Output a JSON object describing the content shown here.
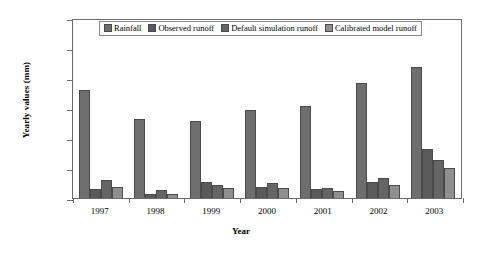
{
  "chart_data": {
    "type": "bar",
    "title": "",
    "xlabel": "Year",
    "ylabel": "Yearly values (mm)",
    "ylim": [
      0,
      1200
    ],
    "yticks": [
      0,
      200,
      400,
      600,
      800,
      1000,
      1200
    ],
    "grid": false,
    "legend_position": "top-center",
    "categories": [
      "1997",
      "1998",
      "1999",
      "2000",
      "2001",
      "2002",
      "2003"
    ],
    "series": [
      {
        "name": "Rainfall",
        "color": "#6e6e6e",
        "values": [
          720,
          525,
          515,
          585,
          615,
          770,
          875
        ]
      },
      {
        "name": "Observed runoff",
        "color": "#5a5a5a",
        "values": [
          60,
          30,
          105,
          75,
          60,
          110,
          325
        ]
      },
      {
        "name": "Default simulation runoff",
        "color": "#656565",
        "values": [
          120,
          55,
          90,
          100,
          70,
          135,
          255
        ]
      },
      {
        "name": "Calibrated model runoff",
        "color": "#8f8f8f",
        "values": [
          75,
          25,
          65,
          70,
          45,
          90,
          200
        ]
      }
    ]
  }
}
